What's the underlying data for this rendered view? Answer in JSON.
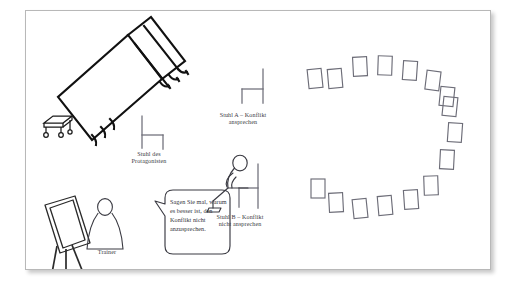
{
  "figure": {
    "title_visible": false,
    "background_color": "#ffffff",
    "panel": {
      "border_color": "#b8b8b8",
      "fill_color": "#ffffff",
      "shadow": true
    },
    "ink_color": "#3b3b43",
    "line_color": "#6d6d78"
  },
  "labels": {
    "chair_a": "Stuhl A – Konflikt\nansprechen",
    "chair_protagonist": "Stuhl des\nProtagonisten",
    "chair_b": "Stuhl B – Konflikt\nnicht ansprechen",
    "trainer": "Trainer"
  },
  "speech_bubble": {
    "speaker": "Trainer",
    "text": "Sagen Sie mal, warum es besser ist, den Konflikt nicht anzusprechen.",
    "tail_side": "left"
  },
  "objects": [
    {
      "name": "table-large",
      "type": "table",
      "description": "großer Tisch in Schrägansicht"
    },
    {
      "name": "trolley-small",
      "type": "cart",
      "description": "kleiner Rollwagen"
    },
    {
      "name": "flipchart-easel",
      "type": "flipchart",
      "description": "Flipchart auf Stativ"
    },
    {
      "name": "trainer-figure",
      "type": "person",
      "description": "Trainer Strichfigur"
    },
    {
      "name": "chair-protagonist",
      "type": "chair",
      "facing": "right"
    },
    {
      "name": "chair-a",
      "type": "chair",
      "facing": "left"
    },
    {
      "name": "chair-b",
      "type": "chair",
      "facing": "left",
      "occupied": true
    },
    {
      "name": "seated-participant",
      "type": "person",
      "description": "sitzende Strichfigur auf Stuhl B"
    },
    {
      "name": "chair-circle",
      "type": "chair-group",
      "count": 16,
      "arrangement": "open circle / Stuhlkreis"
    }
  ],
  "chair_circle": {
    "count": 16,
    "chairs": [
      {
        "i": 1,
        "x": 327,
        "y": 66,
        "w": 14,
        "h": 18,
        "rot": -6
      },
      {
        "i": 2,
        "x": 350,
        "y": 57,
        "w": 14,
        "h": 18,
        "rot": -3
      },
      {
        "i": 3,
        "x": 374,
        "y": 55,
        "w": 14,
        "h": 18,
        "rot": 2
      },
      {
        "i": 4,
        "x": 399,
        "y": 60,
        "w": 14,
        "h": 18,
        "rot": 5
      },
      {
        "i": 5,
        "x": 422,
        "y": 70,
        "w": 14,
        "h": 18,
        "rot": 8
      },
      {
        "i": 6,
        "x": 440,
        "y": 102,
        "w": 14,
        "h": 19,
        "rot": 6
      },
      {
        "i": 7,
        "x": 444,
        "y": 128,
        "w": 14,
        "h": 18,
        "rot": 5
      },
      {
        "i": 8,
        "x": 437,
        "y": 155,
        "w": 14,
        "h": 19,
        "rot": 3
      },
      {
        "i": 9,
        "x": 421,
        "y": 182,
        "w": 14,
        "h": 19,
        "rot": -2
      },
      {
        "i": 10,
        "x": 400,
        "y": 195,
        "w": 14,
        "h": 19,
        "rot": -4
      },
      {
        "i": 11,
        "x": 375,
        "y": 200,
        "w": 14,
        "h": 19,
        "rot": -5
      },
      {
        "i": 12,
        "x": 350,
        "y": 203,
        "w": 14,
        "h": 19,
        "rot": -6
      },
      {
        "i": 13,
        "x": 327,
        "y": 196,
        "w": 14,
        "h": 19,
        "rot": -3
      },
      {
        "i": 14,
        "x": 310,
        "y": 185,
        "w": 14,
        "h": 18,
        "rot": 0
      },
      {
        "i": 15,
        "x": 306,
        "y": 96,
        "w": 14,
        "h": 18,
        "rot": 0
      },
      {
        "i": 16,
        "x": 410,
        "y": 86,
        "w": 14,
        "h": 18,
        "rot": 7
      }
    ]
  }
}
